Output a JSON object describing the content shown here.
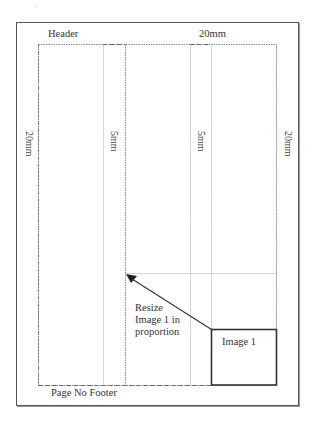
{
  "diagram": {
    "type": "page-layout",
    "labels": {
      "header": "Header",
      "top_margin": "20mm",
      "left_margin": "20mm",
      "right_margin": "20mm",
      "gutter_left": "5mm",
      "gutter_right": "5mm",
      "footer": "Page No Footer",
      "resize_note_line1": "Resize",
      "resize_note_line2": "Image 1 in",
      "resize_note_line3": "proportion",
      "image_box": "Image 1"
    },
    "colors": {
      "border": "#555555",
      "guide_lines": "#999999",
      "dashed_margin": "#777777",
      "arrow": "#333333",
      "image_box": "#333333"
    }
  }
}
